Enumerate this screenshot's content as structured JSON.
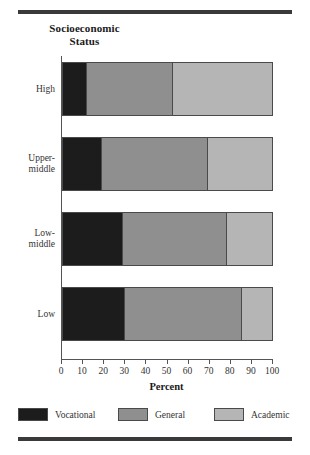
{
  "chart_data": {
    "type": "bar",
    "orientation": "horizontal",
    "stacked": true,
    "stack_total": 100,
    "title": "Socioeconomic Status",
    "title_line1": "Socioeconomic",
    "title_line2": "Status",
    "xlabel": "Percent",
    "ylabel": "",
    "xlim": [
      0,
      100
    ],
    "xticks": [
      0,
      10,
      20,
      30,
      40,
      50,
      60,
      70,
      80,
      90,
      100
    ],
    "xtick_labels": [
      "0",
      "10",
      "20",
      "30",
      "40",
      "50",
      "60",
      "70",
      "80",
      "90",
      "100"
    ],
    "categories": [
      "High",
      "Upper-middle",
      "Low-middle",
      "Low"
    ],
    "category_label_lines": [
      [
        "High"
      ],
      [
        "Upper-",
        "middle"
      ],
      [
        "Low-",
        "middle"
      ],
      [
        "Low"
      ]
    ],
    "grid": false,
    "legend_position": "bottom",
    "series": [
      {
        "name": "Vocational",
        "color": "#1c1c1c",
        "values": [
          11,
          18,
          28,
          29
        ]
      },
      {
        "name": "General",
        "color": "#8f8f8f",
        "values": [
          41,
          51,
          50,
          56
        ]
      },
      {
        "name": "Academic",
        "color": "#b5b5b5",
        "values": [
          48,
          31,
          22,
          15
        ]
      }
    ]
  },
  "legend": [
    {
      "label": "Vocational",
      "swatch": "vocational"
    },
    {
      "label": "General",
      "swatch": "general"
    },
    {
      "label": "Academic",
      "swatch": "academic"
    }
  ]
}
